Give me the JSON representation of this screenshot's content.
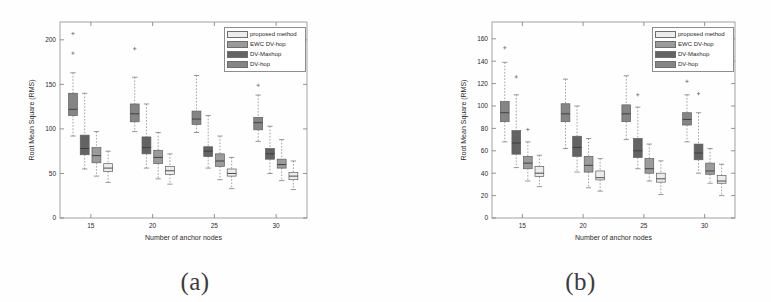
{
  "figure": {
    "background": "#ffffff",
    "panels": [
      {
        "id": "a",
        "caption": "(a)",
        "frame": {
          "left": 60,
          "top": 22,
          "right": 307,
          "bottom": 218
        },
        "legend_pos": "top-right"
      },
      {
        "id": "b",
        "caption": "(b)",
        "frame": {
          "left": 492,
          "top": 22,
          "right": 735,
          "bottom": 218
        },
        "legend_pos": "top-right"
      }
    ]
  },
  "legend": {
    "entries": [
      {
        "label": "proposed method",
        "color": "#ececec"
      },
      {
        "label": "EWC DV-hop",
        "color": "#9b9b9b"
      },
      {
        "label": "DV-Maxhop",
        "color": "#636363"
      },
      {
        "label": "DV-hop",
        "color": "#858585"
      }
    ]
  },
  "chart_data": [
    {
      "type": "box",
      "panel": "a",
      "title": "",
      "xlabel": "Number of anchor nodes",
      "ylabel": "Root Mean Square (RMS)",
      "categories": [
        15,
        20,
        25,
        30
      ],
      "xticks": [
        "15",
        "20",
        "25",
        "30"
      ],
      "yticks": [
        "0",
        "50",
        "100",
        "150",
        "200"
      ],
      "ylim": [
        0,
        220
      ],
      "xlim": [
        12.5,
        32.5
      ],
      "grid": false,
      "series": [
        {
          "name": "DV-hop",
          "color": "#858585",
          "boxes": [
            {
              "x": 15,
              "whislo": 92,
              "q1": 115,
              "med": 122,
              "q3": 140,
              "whishi": 163,
              "fliers": [
                185,
                207
              ]
            },
            {
              "x": 20,
              "whislo": 97,
              "q1": 108,
              "med": 117,
              "q3": 128,
              "whishi": 158,
              "fliers": [
                190
              ]
            },
            {
              "x": 25,
              "whislo": 96,
              "q1": 105,
              "med": 111,
              "q3": 120,
              "whishi": 160,
              "fliers": []
            },
            {
              "x": 30,
              "whislo": 86,
              "q1": 99,
              "med": 107,
              "q3": 113,
              "whishi": 138,
              "fliers": [
                149
              ]
            }
          ]
        },
        {
          "name": "DV-Maxhop",
          "color": "#636363",
          "boxes": [
            {
              "x": 15,
              "whislo": 55,
              "q1": 71,
              "med": 78,
              "q3": 93,
              "whishi": 140,
              "fliers": []
            },
            {
              "x": 20,
              "whislo": 56,
              "q1": 72,
              "med": 79,
              "q3": 91,
              "whishi": 128,
              "fliers": []
            },
            {
              "x": 25,
              "whislo": 56,
              "q1": 69,
              "med": 75,
              "q3": 80,
              "whishi": 115,
              "fliers": []
            },
            {
              "x": 30,
              "whislo": 50,
              "q1": 66,
              "med": 72,
              "q3": 78,
              "whishi": 103,
              "fliers": []
            }
          ]
        },
        {
          "name": "EWC DV-hop",
          "color": "#9b9b9b",
          "boxes": [
            {
              "x": 15,
              "whislo": 47,
              "q1": 62,
              "med": 70,
              "q3": 79,
              "whishi": 97,
              "fliers": []
            },
            {
              "x": 20,
              "whislo": 44,
              "q1": 61,
              "med": 68,
              "q3": 76,
              "whishi": 96,
              "fliers": []
            },
            {
              "x": 25,
              "whislo": 43,
              "q1": 58,
              "med": 64,
              "q3": 72,
              "whishi": 92,
              "fliers": []
            },
            {
              "x": 30,
              "whislo": 42,
              "q1": 56,
              "med": 60,
              "q3": 66,
              "whishi": 88,
              "fliers": []
            }
          ]
        },
        {
          "name": "proposed method",
          "color": "#ececec",
          "boxes": [
            {
              "x": 15,
              "whislo": 40,
              "q1": 52,
              "med": 56,
              "q3": 61,
              "whishi": 75,
              "fliers": []
            },
            {
              "x": 20,
              "whislo": 38,
              "q1": 49,
              "med": 53,
              "q3": 58,
              "whishi": 72,
              "fliers": []
            },
            {
              "x": 25,
              "whislo": 33,
              "q1": 47,
              "med": 50,
              "q3": 55,
              "whishi": 68,
              "fliers": []
            },
            {
              "x": 30,
              "whislo": 32,
              "q1": 43,
              "med": 47,
              "q3": 51,
              "whishi": 64,
              "fliers": []
            }
          ]
        }
      ]
    },
    {
      "type": "box",
      "panel": "b",
      "title": "",
      "xlabel": "Number of anchor nodes",
      "ylabel": "Root Mean Square (RMS)",
      "categories": [
        15,
        20,
        25,
        30
      ],
      "xticks": [
        "15",
        "20",
        "25",
        "30"
      ],
      "yticks": [
        "0",
        "20",
        "40",
        "60",
        "80",
        "100",
        "120",
        "140",
        "160"
      ],
      "ylim": [
        0,
        175
      ],
      "xlim": [
        12.5,
        32.5
      ],
      "grid": false,
      "series": [
        {
          "name": "DV-hop",
          "color": "#858585",
          "boxes": [
            {
              "x": 15,
              "whislo": 68,
              "q1": 86,
              "med": 94,
              "q3": 104,
              "whishi": 139,
              "fliers": [
                152
              ]
            },
            {
              "x": 20,
              "whislo": 62,
              "q1": 86,
              "med": 93,
              "q3": 102,
              "whishi": 124,
              "fliers": []
            },
            {
              "x": 25,
              "whislo": 70,
              "q1": 86,
              "med": 93,
              "q3": 101,
              "whishi": 127,
              "fliers": []
            },
            {
              "x": 30,
              "whislo": 68,
              "q1": 83,
              "med": 88,
              "q3": 94,
              "whishi": 110,
              "fliers": [
                122
              ]
            }
          ]
        },
        {
          "name": "DV-Maxhop",
          "color": "#636363",
          "boxes": [
            {
              "x": 15,
              "whislo": 45,
              "q1": 57,
              "med": 67,
              "q3": 78,
              "whishi": 110,
              "fliers": [
                126
              ]
            },
            {
              "x": 20,
              "whislo": 41,
              "q1": 55,
              "med": 63,
              "q3": 73,
              "whishi": 100,
              "fliers": []
            },
            {
              "x": 25,
              "whislo": 44,
              "q1": 54,
              "med": 60,
              "q3": 71,
              "whishi": 99,
              "fliers": [
                110
              ]
            },
            {
              "x": 30,
              "whislo": 40,
              "q1": 52,
              "med": 58,
              "q3": 66,
              "whishi": 94,
              "fliers": [
                111
              ]
            }
          ]
        },
        {
          "name": "EWC DV-hop",
          "color": "#9b9b9b",
          "boxes": [
            {
              "x": 15,
              "whislo": 33,
              "q1": 44,
              "med": 49,
              "q3": 55,
              "whishi": 68,
              "fliers": [
                79
              ]
            },
            {
              "x": 20,
              "whislo": 27,
              "q1": 41,
              "med": 47,
              "q3": 55,
              "whishi": 71,
              "fliers": []
            },
            {
              "x": 25,
              "whislo": 33,
              "q1": 40,
              "med": 44,
              "q3": 53,
              "whishi": 66,
              "fliers": []
            },
            {
              "x": 30,
              "whislo": 31,
              "q1": 39,
              "med": 42,
              "q3": 49,
              "whishi": 62,
              "fliers": []
            }
          ]
        },
        {
          "name": "proposed method",
          "color": "#ececec",
          "boxes": [
            {
              "x": 15,
              "whislo": 28,
              "q1": 37,
              "med": 40,
              "q3": 46,
              "whishi": 56,
              "fliers": []
            },
            {
              "x": 20,
              "whislo": 24,
              "q1": 34,
              "med": 36,
              "q3": 42,
              "whishi": 53,
              "fliers": []
            },
            {
              "x": 25,
              "whislo": 21,
              "q1": 32,
              "med": 35,
              "q3": 40,
              "whishi": 51,
              "fliers": []
            },
            {
              "x": 30,
              "whislo": 20,
              "q1": 31,
              "med": 33,
              "q3": 38,
              "whishi": 48,
              "fliers": []
            }
          ]
        }
      ]
    }
  ]
}
